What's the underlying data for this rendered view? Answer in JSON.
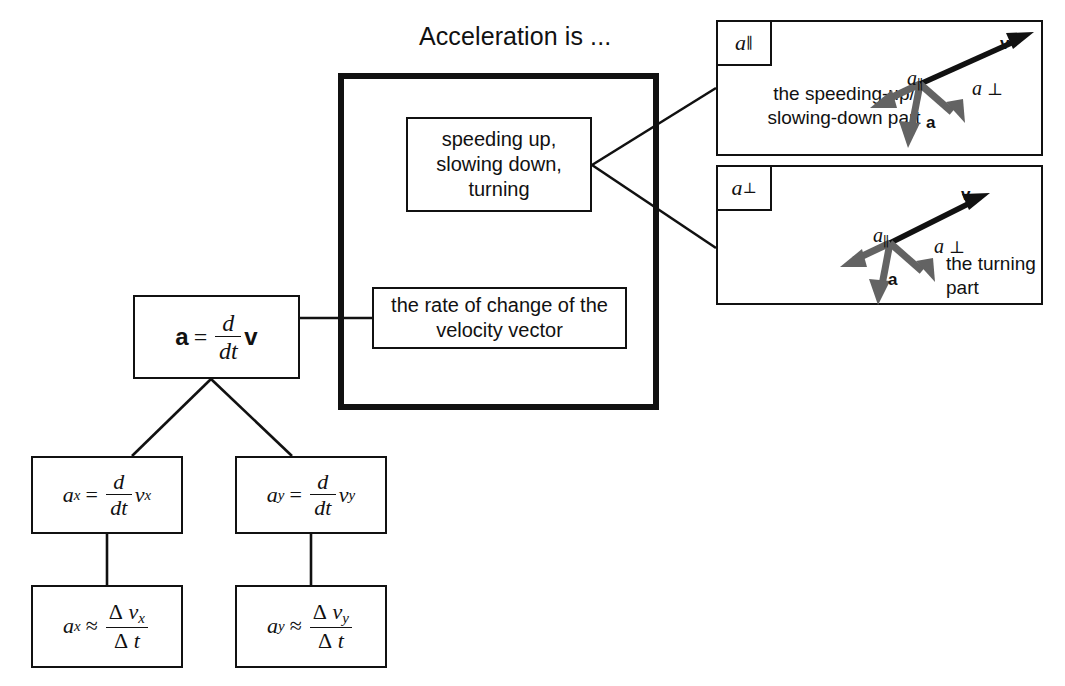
{
  "title": "Acceleration is ...",
  "center_group": {
    "concept_box": {
      "lines": [
        "speeding up,",
        "slowing down,",
        "turning"
      ]
    },
    "definition_box": {
      "lines": [
        "the rate of change of the",
        "velocity vector"
      ]
    }
  },
  "equations": {
    "main": {
      "lhs": "a",
      "equals": "=",
      "numerator": "d",
      "denominator": "dt",
      "rhs": "v"
    },
    "ax_derivative": {
      "lhs": "a",
      "lhs_sub": "x",
      "equals": "=",
      "numerator": "d",
      "denominator": "dt",
      "rhs": "v",
      "rhs_sub": "x"
    },
    "ay_derivative": {
      "lhs": "a",
      "lhs_sub": "y",
      "equals": "=",
      "numerator": "d",
      "denominator": "dt",
      "rhs": "v",
      "rhs_sub": "y"
    },
    "ax_approx": {
      "lhs": "a",
      "lhs_sub": "x",
      "equals": "≈",
      "num_delta": "Δ",
      "num_var": "v",
      "num_sub": "x",
      "den_delta": "Δ",
      "den_var": "t"
    },
    "ay_approx": {
      "lhs": "a",
      "lhs_sub": "y",
      "equals": "≈",
      "num_delta": "Δ",
      "num_var": "v",
      "num_sub": "y",
      "den_delta": "Δ",
      "den_var": "t"
    }
  },
  "panels": [
    {
      "tag_base": "a",
      "tag_sub": "∥",
      "caption_lines": [
        "the speeding-up/",
        "slowing-down part"
      ],
      "caption_align": "center",
      "vectors": {
        "v": "v",
        "a_parallel": "a",
        "a_parallel_sub": "∥",
        "a_perp": "a",
        "a_perp_sub": "⊥",
        "a": "a"
      }
    },
    {
      "tag_base": "a",
      "tag_sub": "⊥",
      "caption_lines": [
        "the turning",
        "part"
      ],
      "caption_align": "left",
      "vectors": {
        "v": "v",
        "a_parallel": "a",
        "a_parallel_sub": "∥",
        "a_perp": "a",
        "a_perp_sub": "⊥",
        "a": "a"
      }
    }
  ],
  "colors": {
    "ink": "#111111",
    "gray_vector": "#636363",
    "paper": "#ffffff"
  }
}
